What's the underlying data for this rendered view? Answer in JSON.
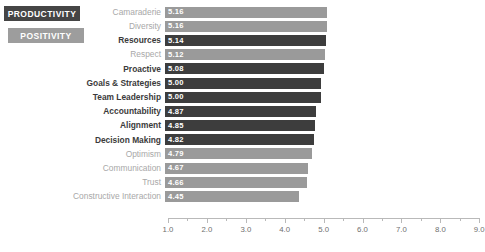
{
  "legend": {
    "items": [
      {
        "label": "PRODUCTIVITY",
        "key": "productivity",
        "color": "#454545"
      },
      {
        "label": "POSITIVITY",
        "key": "positivity",
        "color": "#9d9d9d"
      }
    ]
  },
  "chart_data": {
    "type": "bar",
    "orientation": "horizontal",
    "title": "",
    "xlabel": "",
    "ylabel": "",
    "xlim": [
      1.0,
      9.0
    ],
    "grid": false,
    "legend_position": "top-left",
    "tick_step": 1.0,
    "minor_tick_step": 0.5,
    "tick_labels": [
      "1.0",
      "2.0",
      "3.0",
      "4.0",
      "5.0",
      "6.0",
      "7.0",
      "8.0",
      "9.0"
    ],
    "ticks": [
      1.0,
      2.0,
      3.0,
      4.0,
      5.0,
      6.0,
      7.0,
      8.0,
      9.0
    ],
    "series": [
      {
        "name": "PRODUCTIVITY",
        "color": "#3d3d3d"
      },
      {
        "name": "POSITIVITY",
        "color": "#9a9a9a"
      }
    ],
    "categories": [
      "Camaraderie",
      "Diversity",
      "Resources",
      "Respect",
      "Proactive",
      "Goals & Strategies",
      "Team Leadership",
      "Accountability",
      "Alignment",
      "Decision Making",
      "Optimism",
      "Communication",
      "Trust",
      "Constructive Interaction"
    ],
    "values": [
      5.16,
      5.16,
      5.14,
      5.12,
      5.08,
      5.0,
      5.0,
      4.87,
      4.85,
      4.82,
      4.79,
      4.67,
      4.66,
      4.45
    ],
    "value_labels": [
      "5.16",
      "5.16",
      "5.14",
      "5.12",
      "5.08",
      "5.00",
      "5.00",
      "4.87",
      "4.85",
      "4.82",
      "4.79",
      "4.67",
      "4.66",
      "4.45"
    ],
    "groups": [
      "positivity",
      "positivity",
      "productivity",
      "positivity",
      "productivity",
      "productivity",
      "productivity",
      "productivity",
      "productivity",
      "productivity",
      "positivity",
      "positivity",
      "positivity",
      "positivity"
    ]
  }
}
